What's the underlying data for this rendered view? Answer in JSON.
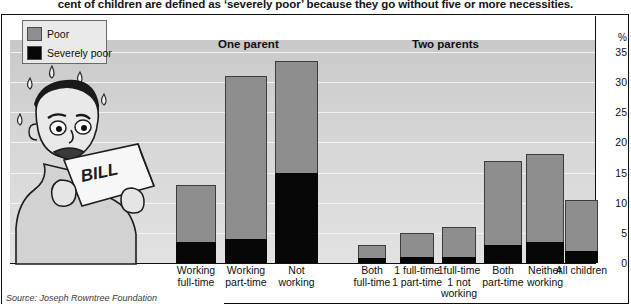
{
  "caption": "cent of children are defined as ‘severely poor’ because they go without five or more necessities.",
  "legend": {
    "items": [
      {
        "label": "Poor",
        "color": "#8e8e8e",
        "icon": "legend-swatch-poor"
      },
      {
        "label": "Severely poor",
        "color": "#070707",
        "icon": "legend-swatch-severely-poor"
      }
    ]
  },
  "groups": [
    {
      "label": "One parent"
    },
    {
      "label": "Two parents"
    }
  ],
  "axis": {
    "unit": "%",
    "ticks": [
      "35",
      "30",
      "25",
      "20",
      "15",
      "10",
      "5",
      "0"
    ]
  },
  "source": "Source: Joseph Rowntree Foundation",
  "chart_data": {
    "type": "bar",
    "title": "",
    "subtitle": "",
    "xlabel": "",
    "ylabel": "%",
    "ylim": [
      0,
      35
    ],
    "yticks": [
      0,
      5,
      10,
      15,
      20,
      25,
      30,
      35
    ],
    "grid": true,
    "stacked": true,
    "legend_position": "top-left",
    "group_labels": [
      "One parent",
      "Two parents"
    ],
    "categories": [
      "Working full-time",
      "Working part-time",
      "Not working",
      "Both full-time",
      "1 full-time 1 part-time",
      "1full-time 1 not working",
      "Both part-time",
      "Neither working",
      "All children"
    ],
    "category_lines": [
      [
        "Working",
        "full-time"
      ],
      [
        "Working",
        "part-time"
      ],
      [
        "Not",
        "working"
      ],
      [
        "Both",
        "full-time"
      ],
      [
        "1 full-time",
        "1 part-time"
      ],
      [
        "1full-time",
        "1 not",
        "working"
      ],
      [
        "Both",
        "part-time"
      ],
      [
        "Neither",
        "working"
      ],
      [
        "All children"
      ]
    ],
    "category_groups": [
      "One parent",
      "One parent",
      "One parent",
      "Two parents",
      "Two parents",
      "Two parents",
      "Two parents",
      "Two parents",
      "All"
    ],
    "series": [
      {
        "name": "Poor",
        "color": "#8e8e8e",
        "values": [
          13,
          31,
          33.5,
          3,
          5,
          6,
          17,
          18,
          10.5
        ]
      },
      {
        "name": "Severely poor",
        "color": "#070707",
        "values": [
          3.5,
          4,
          15,
          0.8,
          1,
          1,
          3,
          3.5,
          2
        ]
      }
    ]
  }
}
